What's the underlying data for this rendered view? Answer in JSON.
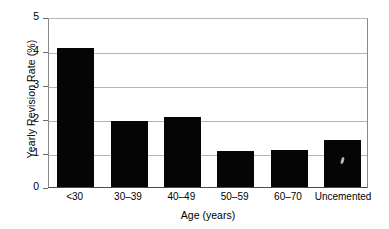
{
  "chart_data": {
    "type": "bar",
    "title": "",
    "xlabel": "Age (years)",
    "ylabel": "Yearly Revision Rate (%)",
    "categories": [
      "<30",
      "30–39",
      "40–49",
      "50–59",
      "60–70",
      "Uncemented"
    ],
    "values": [
      4.1,
      1.93,
      2.05,
      1.06,
      1.08,
      1.38
    ],
    "ylim": [
      0,
      5
    ],
    "yticks": [
      0,
      1,
      2,
      3,
      4,
      5
    ],
    "ytick_labels": [
      "0",
      "1",
      "2",
      "3",
      "4",
      "5"
    ],
    "grid": true,
    "grid_axis": "y",
    "legend": "none",
    "bar_color": "#050505",
    "grid_color": "#b4b4b4",
    "axis_color": "#4a4a4a",
    "background_color": "#ffffff"
  }
}
